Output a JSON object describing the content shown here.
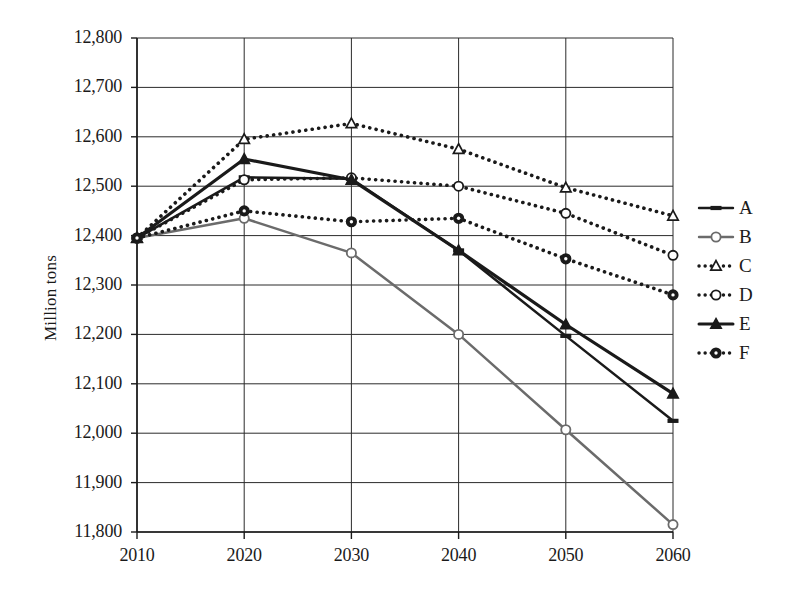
{
  "chart_data": {
    "type": "line",
    "title": "",
    "xlabel": "",
    "ylabel": "Million tons",
    "categories": [
      "2010",
      "2020",
      "2030",
      "2040",
      "2050",
      "2060"
    ],
    "x": [
      2010,
      2020,
      2030,
      2040,
      2050,
      2060
    ],
    "ylim": [
      11800,
      12800
    ],
    "yticks": [
      "11,800",
      "11,900",
      "12,000",
      "12,100",
      "12,200",
      "12,300",
      "12,400",
      "12,500",
      "12,600",
      "12,700",
      "12,800"
    ],
    "ytick_values": [
      11800,
      11900,
      12000,
      12100,
      12200,
      12300,
      12400,
      12500,
      12600,
      12700,
      12800
    ],
    "grid": true,
    "legend_position": "right",
    "series": [
      {
        "name": "A",
        "values": [
          12395,
          12518,
          12515,
          12370,
          12197,
          12025
        ],
        "color": "#1a1a1a",
        "style": "solid",
        "marker": "dash"
      },
      {
        "name": "B",
        "values": [
          12395,
          12435,
          12365,
          12200,
          12007,
          11815
        ],
        "color": "#6b6b6b",
        "style": "solid",
        "marker": "open-circle"
      },
      {
        "name": "C",
        "values": [
          12395,
          12595,
          12627,
          12575,
          12497,
          12440
        ],
        "color": "#1a1a1a",
        "style": "dotted",
        "marker": "open-triangle"
      },
      {
        "name": "D",
        "values": [
          12395,
          12513,
          12517,
          12500,
          12445,
          12360
        ],
        "color": "#1a1a1a",
        "style": "dotted",
        "marker": "open-circle"
      },
      {
        "name": "E",
        "values": [
          12395,
          12555,
          12513,
          12370,
          12220,
          12080
        ],
        "color": "#1a1a1a",
        "style": "solid",
        "marker": "filled-triangle"
      },
      {
        "name": "F",
        "values": [
          12395,
          12450,
          12428,
          12435,
          12353,
          12280
        ],
        "color": "#1a1a1a",
        "style": "dotted",
        "marker": "filled-circle"
      }
    ]
  },
  "legend": {
    "items": [
      {
        "label": "A",
        "key": "line-dash-key"
      },
      {
        "label": "B",
        "key": "line-open-circle-key"
      },
      {
        "label": "C",
        "key": "dotted-open-triangle-key"
      },
      {
        "label": "D",
        "key": "dotted-open-circle-key"
      },
      {
        "label": "E",
        "key": "line-filled-triangle-key"
      },
      {
        "label": "F",
        "key": "dotted-filled-circle-key"
      }
    ]
  },
  "axes": {
    "y_title": "Million tons"
  }
}
